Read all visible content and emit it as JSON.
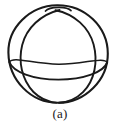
{
  "figure": {
    "caption": "(a)",
    "label_text": "(a)",
    "background_color": "#ffffff",
    "stroke_color": "#1a1a1a",
    "outline": {
      "name": "sphere-outline",
      "center_x": 58,
      "center_y": 54,
      "radius_x": 50,
      "radius_y": 49,
      "stroke_width": 2.0
    },
    "meridian_left": {
      "name": "meridian-left",
      "start_x": 58,
      "start_y": 11,
      "end_x": 56,
      "end_y": 101,
      "bulge_x": 18,
      "stroke_width": 1.8
    },
    "meridian_right": {
      "name": "meridian-right",
      "start_x": 56,
      "start_y": 11,
      "end_x": 60,
      "end_y": 101,
      "bulge_x": 98,
      "stroke_width": 1.8
    },
    "equator": {
      "name": "equator-circle",
      "center_x": 58,
      "center_y": 72,
      "radius_x": 49,
      "radius_y": 15,
      "stroke_width": 1.8
    },
    "pole_cap": {
      "name": "north-pole-cap",
      "center_x": 58,
      "center_y": 9,
      "radius_x": 13,
      "radius_y": 4
    }
  }
}
